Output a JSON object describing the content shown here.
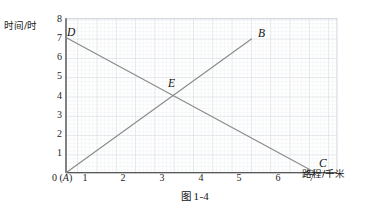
{
  "figure": {
    "caption_cn": "图",
    "caption_num": "1-4",
    "y_axis_label": "时间/时",
    "x_axis_label": "路程/千米"
  },
  "chart_data": {
    "type": "line",
    "title": "图 1-4",
    "xlabel": "路程/千米",
    "ylabel": "时间/时",
    "xlim": [
      0,
      7.6
    ],
    "ylim": [
      0,
      8
    ],
    "grid": true,
    "grid_major_step": 1,
    "grid_minor_per_major": 5,
    "legend": "none",
    "x_ticks": [
      "0",
      "1",
      "2",
      "3",
      "4",
      "5",
      "6",
      "7"
    ],
    "y_ticks": [
      "1",
      "2",
      "3",
      "4",
      "5",
      "6",
      "7",
      "8"
    ],
    "origin_label": "0 (A)",
    "series": [
      {
        "name": "AB",
        "points": [
          [
            0,
            0
          ],
          [
            5.2,
            6.93
          ]
        ],
        "color": "#8b8b8b",
        "start_label": "A",
        "end_label": "B"
      },
      {
        "name": "DC",
        "points": [
          [
            0,
            7
          ],
          [
            7,
            0
          ]
        ],
        "color": "#8b8b8b",
        "start_label": "D",
        "end_label": "C"
      }
    ],
    "annotations": [
      {
        "label": "D",
        "x": 0,
        "y": 7
      },
      {
        "label": "B",
        "x": 5.2,
        "y": 6.93
      },
      {
        "label": "E",
        "x": 3,
        "y": 4
      },
      {
        "label": "C",
        "x": 7,
        "y": 0
      },
      {
        "label": "A",
        "x": 0,
        "y": 0
      }
    ],
    "intersection": {
      "label": "E",
      "x": 3,
      "y": 4
    }
  }
}
